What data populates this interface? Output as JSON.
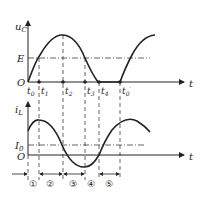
{
  "top_chart": {
    "y_label": "u",
    "y_label_sub": "C",
    "x_label": "t",
    "origin": "O",
    "level_label": "E",
    "ticks": [
      {
        "label": "t",
        "sub": "0",
        "x": 29
      },
      {
        "label": "t",
        "sub": "1",
        "x": 39
      },
      {
        "label": "t",
        "sub": "2",
        "x": 63
      },
      {
        "label": "t",
        "sub": "3",
        "x": 85
      },
      {
        "label": "t",
        "sub": "4",
        "x": 99
      },
      {
        "label": "t",
        "sub": "0'",
        "x": 120
      }
    ]
  },
  "bottom_chart": {
    "y_label": "i",
    "y_label_sub": "L",
    "x_label": "t",
    "origin": "O",
    "level_label": "I",
    "level_label_sub": "0"
  },
  "intervals": [
    "①",
    "②",
    "③",
    "④",
    "⑤"
  ]
}
